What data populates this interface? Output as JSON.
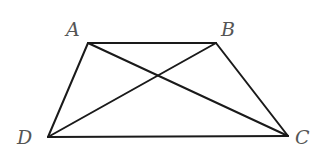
{
  "figure": {
    "type": "trapezoid-with-diagonals",
    "stroke_color": "#1a1a1a",
    "label_color": "#555555",
    "vertices": [
      {
        "id": "A",
        "label": "A",
        "x": 88,
        "y": 43,
        "label_x": 66,
        "label_y": 20
      },
      {
        "id": "B",
        "label": "B",
        "x": 216,
        "y": 43,
        "label_x": 221,
        "label_y": 20
      },
      {
        "id": "C",
        "label": "C",
        "x": 288,
        "y": 136,
        "label_x": 295,
        "label_y": 128
      },
      {
        "id": "D",
        "label": "D",
        "x": 48,
        "y": 137,
        "label_x": 17,
        "label_y": 128
      }
    ],
    "segments": [
      {
        "name": "AB",
        "from": "A",
        "to": "B"
      },
      {
        "name": "BC",
        "from": "B",
        "to": "C"
      },
      {
        "name": "CD",
        "from": "C",
        "to": "D"
      },
      {
        "name": "DA",
        "from": "D",
        "to": "A"
      },
      {
        "name": "AC",
        "from": "A",
        "to": "C"
      },
      {
        "name": "BD",
        "from": "B",
        "to": "D"
      }
    ]
  }
}
